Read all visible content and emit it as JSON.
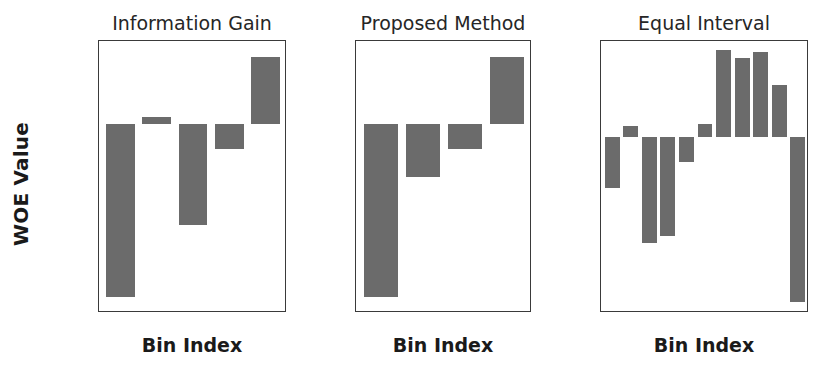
{
  "figure": {
    "ylabel": "WOE Value",
    "background": "#ffffff",
    "bar_color": "#6b6b6b",
    "axis_color": "#3a3a3a",
    "text_color": "#1a1a1a"
  },
  "chart_data": [
    {
      "type": "bar",
      "title": "Information Gain",
      "xlabel": "Bin Index",
      "ylabel": "WOE Value",
      "categories": [
        "0",
        "1",
        "2",
        "3",
        "4"
      ],
      "values": [
        -0.98,
        0.04,
        -0.57,
        -0.14,
        0.38
      ],
      "xticks": [
        "0",
        "1",
        "2",
        "3",
        "4"
      ],
      "yticks": [
        "0.4",
        "0.2",
        "0.0",
        "-0.2",
        "-0.4",
        "-0.6",
        "-0.8",
        "-1.0"
      ],
      "ytick_values": [
        0.4,
        0.2,
        0.0,
        -0.2,
        -0.4,
        -0.6,
        -0.8,
        -1.0
      ],
      "ylim": [
        -1.07,
        0.47
      ],
      "xlim": [
        -0.6,
        4.6
      ],
      "grid": false,
      "legend": "none"
    },
    {
      "type": "bar",
      "title": "Proposed Method",
      "xlabel": "Bin Index",
      "ylabel": "WOE Value",
      "categories": [
        "0",
        "1",
        "2",
        "3"
      ],
      "values": [
        -0.98,
        -0.3,
        -0.14,
        0.38
      ],
      "xticks": [
        "0",
        "1",
        "2",
        "3"
      ],
      "yticks": [
        "0.4",
        "0.2",
        "0.0",
        "-0.2",
        "-0.4",
        "-0.6",
        "-0.8",
        "-1.0"
      ],
      "ytick_values": [
        0.4,
        0.2,
        0.0,
        -0.2,
        -0.4,
        -0.6,
        -0.8,
        -1.0
      ],
      "ylim": [
        -1.07,
        0.47
      ],
      "xlim": [
        -0.6,
        3.6
      ],
      "grid": false,
      "legend": "none"
    },
    {
      "type": "bar",
      "title": "Equal Interval",
      "xlabel": "Bin Index",
      "ylabel": "WOE Value",
      "categories": [
        "0",
        "1",
        "2",
        "3",
        "4",
        "5",
        "6",
        "7",
        "8",
        "9",
        "10"
      ],
      "values": [
        -0.28,
        0.06,
        -0.58,
        -0.54,
        -0.14,
        0.07,
        0.47,
        0.43,
        0.46,
        0.28,
        -0.9
      ],
      "xticks": [
        "0",
        "2",
        "4",
        "6",
        "8",
        "10"
      ],
      "xtick_values": [
        0,
        2,
        4,
        6,
        8,
        10
      ],
      "yticks": [
        "0.4",
        "0.2",
        "0.0",
        "-0.2",
        "-0.4",
        "-0.6",
        "-0.8"
      ],
      "ytick_values": [
        0.4,
        0.2,
        0.0,
        -0.2,
        -0.4,
        -0.6,
        -0.8
      ],
      "ylim": [
        -0.96,
        0.52
      ],
      "xlim": [
        -0.6,
        10.6
      ],
      "grid": false,
      "legend": "none"
    }
  ],
  "panels_layout": [
    {
      "left": 98,
      "width": 188
    },
    {
      "left": 355,
      "width": 176
    },
    {
      "left": 600,
      "width": 208
    }
  ]
}
